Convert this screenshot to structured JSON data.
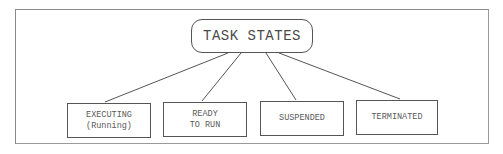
{
  "diagram": {
    "type": "tree",
    "root": {
      "label": "TASK STATES"
    },
    "children": [
      {
        "line1": "EXECUTING",
        "line2": "(Running)"
      },
      {
        "line1": "READY",
        "line2": "TO RUN"
      },
      {
        "line1": "SUSPENDED",
        "line2": ""
      },
      {
        "line1": "TERMINATED",
        "line2": ""
      }
    ],
    "colors": {
      "stroke": "#555555",
      "text": "#555555",
      "frame": "#8a8a8a",
      "background": "#ffffff"
    }
  }
}
